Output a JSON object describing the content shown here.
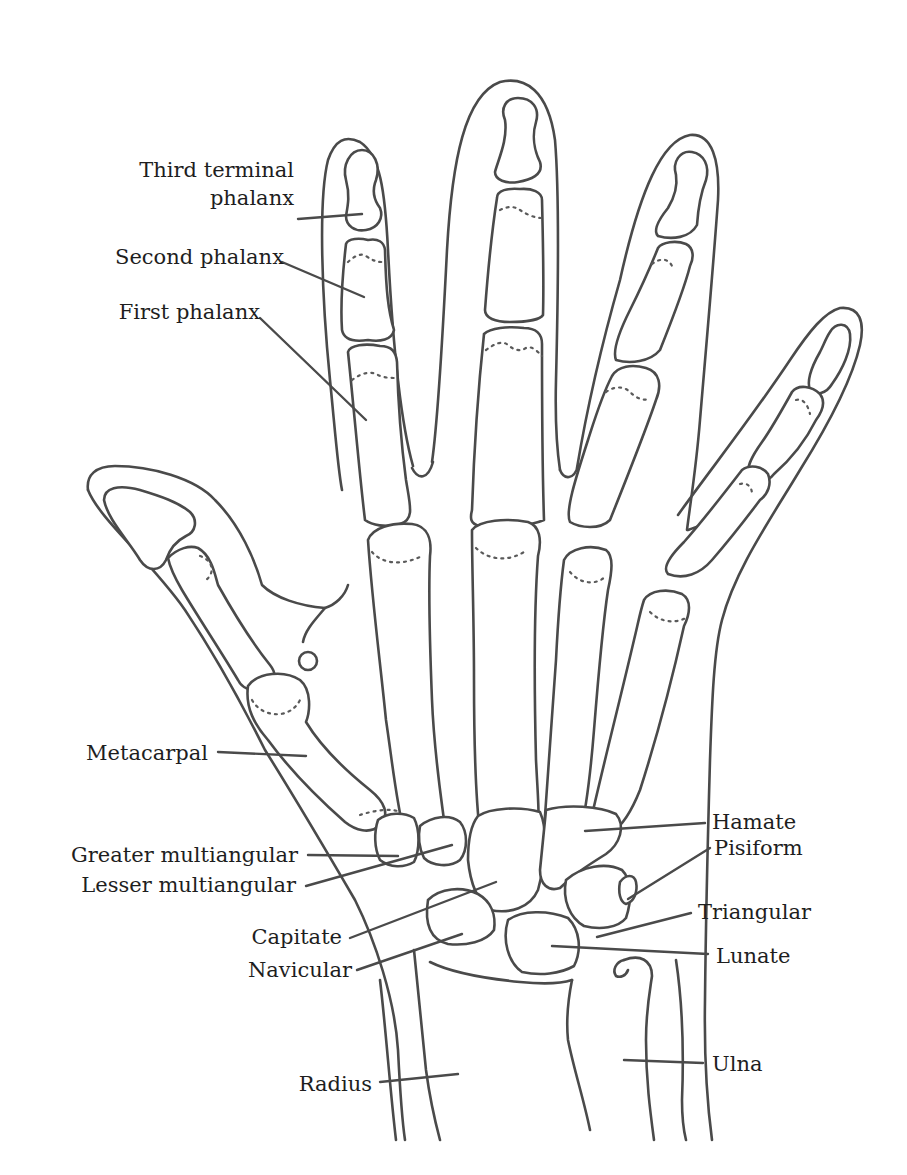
{
  "diagram": {
    "line_color": "#4a4a4a",
    "text_color": "#1e1e1e",
    "background": "#ffffff"
  },
  "labels": {
    "third_terminal_phalanx": {
      "line1": "Third terminal",
      "line2": "phalanx"
    },
    "second_phalanx": "Second phalanx",
    "first_phalanx": "First phalanx",
    "metacarpal": "Metacarpal",
    "greater_multiangular": "Greater multiangular",
    "lesser_multiangular": "Lesser multiangular",
    "capitate": "Capitate",
    "navicular": "Navicular",
    "radius": "Radius",
    "hamate": "Hamate",
    "pisiform": "Pisiform",
    "triangular": "Triangular",
    "lunate": "Lunate",
    "ulna": "Ulna"
  },
  "leaders": [
    {
      "name": "third-terminal-phalanx",
      "from": [
        298,
        219
      ],
      "to": [
        362,
        214
      ]
    },
    {
      "name": "second-phalanx",
      "from": [
        282,
        262
      ],
      "to": [
        364,
        297
      ]
    },
    {
      "name": "first-phalanx",
      "from": [
        260,
        318
      ],
      "to": [
        366,
        420
      ]
    },
    {
      "name": "metacarpal",
      "from": [
        218,
        752
      ],
      "to": [
        306,
        756
      ]
    },
    {
      "name": "greater-multiangular",
      "from": [
        308,
        855
      ],
      "to": [
        398,
        856
      ]
    },
    {
      "name": "lesser-multiangular",
      "from": [
        306,
        886
      ],
      "to": [
        452,
        845
      ]
    },
    {
      "name": "capitate",
      "from": [
        350,
        938
      ],
      "to": [
        496,
        882
      ]
    },
    {
      "name": "navicular",
      "from": [
        357,
        970
      ],
      "to": [
        462,
        934
      ]
    },
    {
      "name": "radius",
      "from": [
        380,
        1082
      ],
      "to": [
        458,
        1074
      ]
    },
    {
      "name": "hamate",
      "from": [
        585,
        831
      ],
      "to": [
        705,
        823
      ]
    },
    {
      "name": "pisiform",
      "from": [
        628,
        899
      ],
      "to": [
        710,
        848
      ]
    },
    {
      "name": "triangular",
      "from": [
        597,
        937
      ],
      "to": [
        691,
        913
      ]
    },
    {
      "name": "lunate",
      "from": [
        552,
        946
      ],
      "to": [
        708,
        954
      ]
    },
    {
      "name": "ulna",
      "from": [
        624,
        1060
      ],
      "to": [
        703,
        1063
      ]
    }
  ]
}
